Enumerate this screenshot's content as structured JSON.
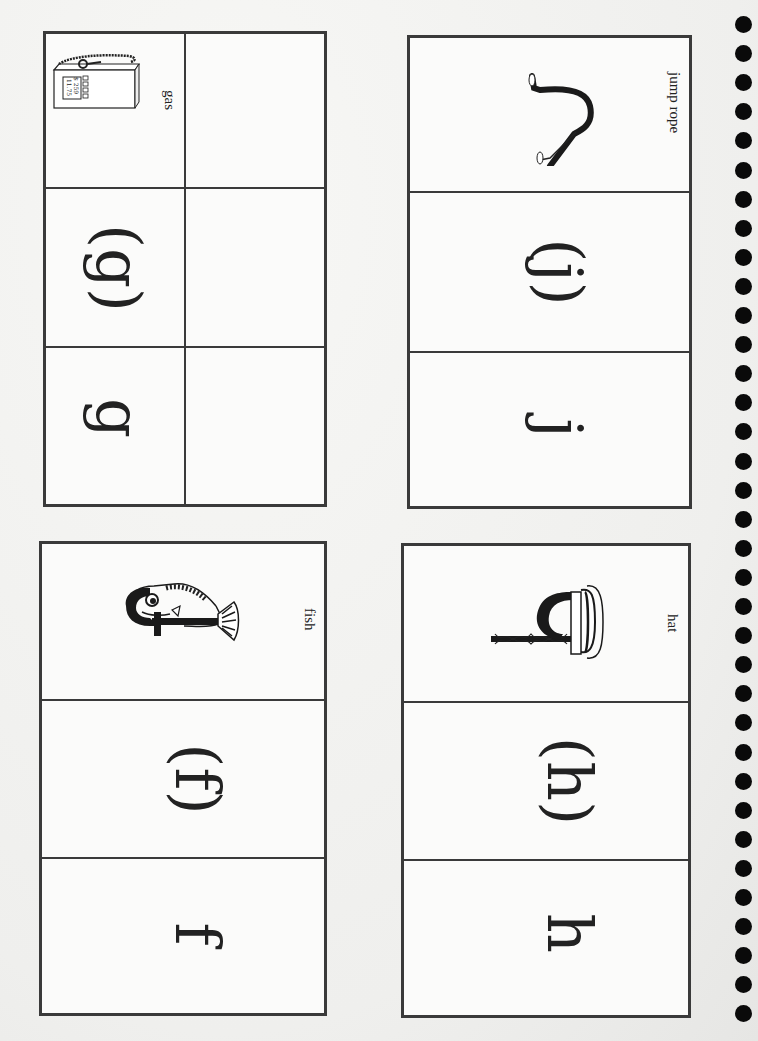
{
  "worksheet": {
    "orientation": "rotated-90-clockwise",
    "cards": [
      {
        "id": "g",
        "letter": "g",
        "letter_in_parens": "(g)",
        "picture_word": "gas",
        "picture_icon": "gas-pump-icon",
        "has_blank_column": true
      },
      {
        "id": "j",
        "letter": "j",
        "letter_in_parens": "(j)",
        "picture_word": "jump rope",
        "picture_icon": "jump-rope-icon",
        "has_blank_column": false
      },
      {
        "id": "f",
        "letter": "f",
        "letter_in_parens": "(f)",
        "picture_word": "fish",
        "picture_icon": "fish-icon",
        "has_blank_column": false
      },
      {
        "id": "h",
        "letter": "h",
        "letter_in_parens": "(h)",
        "picture_word": "hat",
        "picture_icon": "hat-icon",
        "has_blank_column": false
      }
    ],
    "gas_pump_display": [
      "$ 259",
      "11.75"
    ],
    "binding_holes": {
      "count": 35,
      "color": "#0a0a0a"
    }
  }
}
